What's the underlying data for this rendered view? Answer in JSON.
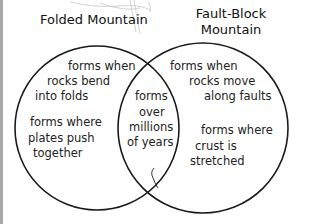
{
  "diagram": {
    "type": "venn",
    "sets": [
      {
        "title": "Folded Mountain",
        "unique_facts": [
          "forms when rocks bend into folds",
          "forms where plates push together"
        ]
      },
      {
        "title_lines": [
          "Fault-Block",
          "Mountain"
        ],
        "unique_facts": [
          "forms when rocks move along faults",
          "forms where crust is stretched"
        ]
      }
    ],
    "shared": [
      "forms",
      "over",
      "millions",
      "of years"
    ],
    "left_lines": {
      "a1": "forms when",
      "a2": "rocks bend",
      "a3": "into folds",
      "b1": "forms where",
      "b2": "plates push",
      "b3": "together"
    },
    "right_lines": {
      "a1": "forms when",
      "a2": "rocks move",
      "a3": "along faults",
      "b1": "forms where",
      "b2": "crust is",
      "b3": "stretched"
    },
    "colors": {
      "outline": "#1a1a1a",
      "text": "#222222",
      "frame": "#a9a9a9"
    }
  }
}
